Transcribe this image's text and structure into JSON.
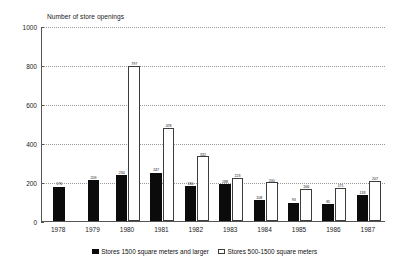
{
  "chart_data": {
    "type": "bar",
    "title": "Number of store openings",
    "xlabel": "",
    "ylabel": "",
    "ylim": [
      0,
      1000
    ],
    "ytick_labels": [
      "1000",
      "800",
      "600",
      "400",
      "200",
      "0"
    ],
    "ytick_values": [
      1000,
      800,
      600,
      400,
      200,
      0
    ],
    "grid": true,
    "legend_position": "bottom",
    "categories": [
      "1978",
      "1979",
      "1980",
      "1981",
      "1982",
      "1983",
      "1984",
      "1985",
      "1986",
      "1987"
    ],
    "series": [
      {
        "name": "Stores 1500 square meters and larger",
        "style": "solid-black",
        "color": "#0b0b0b",
        "values": [
          176,
          209,
          234,
          247,
          180,
          188,
          108,
          93,
          85,
          133
        ],
        "labels": [
          "176",
          "209",
          "234",
          "247",
          "180",
          "188",
          "108",
          "93",
          "85",
          "133"
        ]
      },
      {
        "name": "Stores 500-1500 square meters",
        "style": "dotted-hatch",
        "color": "#cccccc",
        "values": [
          null,
          null,
          797,
          478,
          332,
          223,
          200,
          166,
          171,
          207
        ],
        "labels": [
          "",
          "",
          "797",
          "478",
          "332",
          "223",
          "200",
          "166",
          "171",
          "207"
        ]
      }
    ]
  },
  "legend": {
    "entries": [
      {
        "label": "Stores 1500 square meters and larger",
        "swatch": "solid"
      },
      {
        "label": "Stores 500-1500 square meters",
        "swatch": "hatched"
      }
    ]
  }
}
